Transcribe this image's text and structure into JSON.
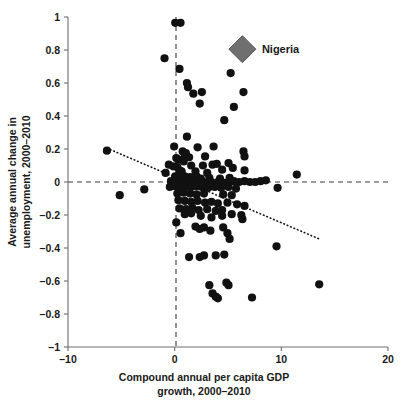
{
  "chart_data": {
    "type": "scatter",
    "title": "",
    "xlabel": "Compound annual per capita GDP growth, 2000–2010",
    "xlabel_line1": "Compound annual per capita GDP",
    "xlabel_line2": "growth, 2000–2010",
    "ylabel": "Average annual change in unemployment, 2000–2010",
    "ylabel_line1": "Average annual change in",
    "ylabel_line2": "unemployment, 2000–2010",
    "xlim": [
      -10,
      20
    ],
    "ylim": [
      -1,
      1
    ],
    "xticks": [
      -10,
      0,
      10,
      20
    ],
    "xtick_labels": [
      "–10",
      "0",
      "10",
      "20"
    ],
    "yticks": [
      -1,
      -0.8,
      -0.6,
      -0.4,
      -0.2,
      0,
      0.2,
      0.4,
      0.6,
      0.8,
      1
    ],
    "ytick_labels": [
      "–1",
      "–0.8",
      "–0.6",
      "–0.4",
      "–0.2",
      "0",
      "0.2",
      "0.4",
      "0.6",
      "0.8",
      "1"
    ],
    "grid": false,
    "legend_position": "inline-annotation",
    "reference_lines": [
      {
        "name": "zero-unemployment-change",
        "orientation": "horizontal",
        "value": 0,
        "style": "dashed"
      },
      {
        "name": "zero-gdp-growth",
        "orientation": "vertical",
        "value": 0,
        "style": "dashed"
      }
    ],
    "trendline": {
      "name": "fitted-regression",
      "style": "dotted",
      "x_start": -6.35,
      "y_start": 0.205,
      "x_end": 13.55,
      "y_end": -0.345,
      "slope": -0.0276,
      "intercept": 0.0295
    },
    "annotations": [
      {
        "name": "nigeria-marker",
        "label": "Nigeria",
        "x": 6.35,
        "y": 0.805,
        "marker": "diamond",
        "color": "#6f6f6f",
        "label_color": "#1a1a1a"
      }
    ],
    "series": [
      {
        "name": "Countries",
        "marker": "circle",
        "color": "#111111",
        "points": [
          [
            0.05,
            0.965
          ],
          [
            0.55,
            0.965
          ],
          [
            -0.95,
            0.75
          ],
          [
            0.45,
            0.685
          ],
          [
            1.15,
            0.6
          ],
          [
            1.25,
            0.575
          ],
          [
            1.75,
            0.535
          ],
          [
            2.55,
            0.545
          ],
          [
            2.35,
            0.475
          ],
          [
            5.25,
            0.66
          ],
          [
            6.45,
            0.545
          ],
          [
            5.55,
            0.455
          ],
          [
            4.65,
            0.375
          ],
          [
            1.15,
            0.275
          ],
          [
            -6.35,
            0.19
          ],
          [
            -0.05,
            0.215
          ],
          [
            2.15,
            0.21
          ],
          [
            3.65,
            0.215
          ],
          [
            0.75,
            0.185
          ],
          [
            1.05,
            0.175
          ],
          [
            0.95,
            0.155
          ],
          [
            1.35,
            0.15
          ],
          [
            2.85,
            0.155
          ],
          [
            6.45,
            0.185
          ],
          [
            6.55,
            0.155
          ],
          [
            0.15,
            0.145
          ],
          [
            0.35,
            0.135
          ],
          [
            0.85,
            0.125
          ],
          [
            5.05,
            0.115
          ],
          [
            -0.55,
            0.105
          ],
          [
            -0.15,
            0.095
          ],
          [
            0.25,
            0.09
          ],
          [
            1.55,
            0.1
          ],
          [
            2.65,
            0.1
          ],
          [
            3.55,
            0.105
          ],
          [
            3.95,
            0.11
          ],
          [
            -0.85,
            0.055
          ],
          [
            0.45,
            0.07
          ],
          [
            0.65,
            0.065
          ],
          [
            1.95,
            0.065
          ],
          [
            3.05,
            0.055
          ],
          [
            4.45,
            0.075
          ],
          [
            5.45,
            0.085
          ],
          [
            6.55,
            0.07
          ],
          [
            11.45,
            0.045
          ],
          [
            0.05,
            0.035
          ],
          [
            0.35,
            0.03
          ],
          [
            0.95,
            0.035
          ],
          [
            1.45,
            0.03
          ],
          [
            2.05,
            0.035
          ],
          [
            2.45,
            0.02
          ],
          [
            3.25,
            0.025
          ],
          [
            4.25,
            0.02
          ],
          [
            5.15,
            0.025
          ],
          [
            -0.35,
            0.005
          ],
          [
            0.15,
            0.0
          ],
          [
            0.65,
            0.005
          ],
          [
            1.05,
            0.0
          ],
          [
            1.45,
            -0.005
          ],
          [
            1.85,
            0.0
          ],
          [
            2.25,
            -0.005
          ],
          [
            2.65,
            0.0
          ],
          [
            3.05,
            -0.005
          ],
          [
            3.45,
            0.0
          ],
          [
            4.05,
            0.0
          ],
          [
            4.65,
            -0.005
          ],
          [
            5.05,
            0.0
          ],
          [
            5.55,
            0.005
          ],
          [
            6.05,
            0.0
          ],
          [
            6.55,
            0.005
          ],
          [
            7.05,
            0.0
          ],
          [
            7.55,
            0.0
          ],
          [
            8.05,
            0.005
          ],
          [
            8.55,
            0.01
          ],
          [
            -0.45,
            -0.03
          ],
          [
            0.05,
            -0.025
          ],
          [
            0.55,
            -0.03
          ],
          [
            1.05,
            -0.025
          ],
          [
            1.55,
            -0.03
          ],
          [
            2.05,
            -0.025
          ],
          [
            2.55,
            -0.03
          ],
          [
            3.15,
            -0.035
          ],
          [
            3.75,
            -0.03
          ],
          [
            4.35,
            -0.035
          ],
          [
            5.05,
            -0.03
          ],
          [
            5.75,
            -0.04
          ],
          [
            9.65,
            -0.035
          ],
          [
            -2.85,
            -0.045
          ],
          [
            -5.15,
            -0.08
          ],
          [
            0.25,
            -0.07
          ],
          [
            0.85,
            -0.065
          ],
          [
            1.45,
            -0.07
          ],
          [
            2.05,
            -0.075
          ],
          [
            2.75,
            -0.07
          ],
          [
            4.55,
            -0.075
          ],
          [
            5.35,
            -0.08
          ],
          [
            0.35,
            -0.11
          ],
          [
            0.95,
            -0.115
          ],
          [
            1.55,
            -0.12
          ],
          [
            2.15,
            -0.115
          ],
          [
            2.85,
            -0.125
          ],
          [
            3.45,
            -0.12
          ],
          [
            4.05,
            -0.13
          ],
          [
            4.95,
            -0.125
          ],
          [
            5.85,
            -0.135
          ],
          [
            6.55,
            -0.145
          ],
          [
            0.45,
            -0.16
          ],
          [
            1.05,
            -0.165
          ],
          [
            1.65,
            -0.155
          ],
          [
            2.25,
            -0.17
          ],
          [
            3.05,
            -0.165
          ],
          [
            3.85,
            -0.175
          ],
          [
            4.45,
            -0.17
          ],
          [
            0.15,
            -0.245
          ],
          [
            0.95,
            -0.195
          ],
          [
            1.55,
            -0.19
          ],
          [
            2.45,
            -0.205
          ],
          [
            3.45,
            -0.215
          ],
          [
            4.45,
            -0.205
          ],
          [
            5.35,
            -0.195
          ],
          [
            6.25,
            -0.2
          ],
          [
            0.55,
            -0.31
          ],
          [
            1.95,
            -0.27
          ],
          [
            2.35,
            -0.285
          ],
          [
            2.75,
            -0.275
          ],
          [
            3.35,
            -0.295
          ],
          [
            4.55,
            -0.275
          ],
          [
            4.95,
            -0.31
          ],
          [
            5.15,
            -0.345
          ],
          [
            6.35,
            -0.225
          ],
          [
            1.35,
            -0.455
          ],
          [
            2.35,
            -0.455
          ],
          [
            2.75,
            -0.445
          ],
          [
            3.85,
            -0.445
          ],
          [
            4.65,
            -0.44
          ],
          [
            9.55,
            -0.39
          ],
          [
            3.25,
            -0.625
          ],
          [
            4.85,
            -0.61
          ],
          [
            5.05,
            -0.625
          ],
          [
            13.55,
            -0.62
          ],
          [
            3.55,
            -0.675
          ],
          [
            3.85,
            -0.695
          ],
          [
            4.05,
            -0.705
          ],
          [
            7.25,
            -0.7
          ]
        ]
      }
    ]
  }
}
